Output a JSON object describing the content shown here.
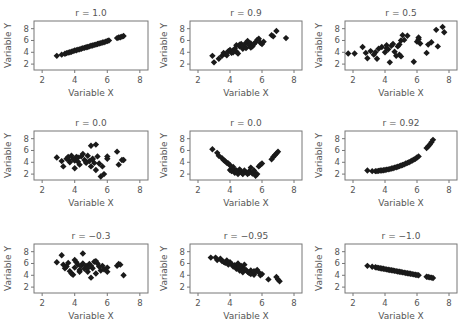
{
  "chart_data": [
    {
      "type": "scatter",
      "title": "r = 1.0",
      "xlabel": "Variable X",
      "ylabel": "Variable Y",
      "xticks": [
        2,
        4,
        6,
        8
      ],
      "yticks": [
        2,
        4,
        6,
        8
      ],
      "xlim": [
        1.5,
        8.5
      ],
      "ylim": [
        1,
        9.3
      ],
      "grid": false,
      "x": [
        2.9,
        3.2,
        3.4,
        3.5,
        3.6,
        3.7,
        3.8,
        3.9,
        4.0,
        4.1,
        4.2,
        4.3,
        4.4,
        4.5,
        4.6,
        4.7,
        4.8,
        4.9,
        5.0,
        5.1,
        5.2,
        5.3,
        5.4,
        5.5,
        5.6,
        5.7,
        5.8,
        5.9,
        6.0,
        6.1,
        6.6,
        6.7,
        6.8,
        6.9,
        7.0
      ],
      "y": [
        3.4,
        3.6,
        3.75,
        3.85,
        3.95,
        4.0,
        4.1,
        4.2,
        4.3,
        4.35,
        4.45,
        4.5,
        4.6,
        4.7,
        4.75,
        4.85,
        4.9,
        5.0,
        5.1,
        5.15,
        5.25,
        5.3,
        5.4,
        5.5,
        5.55,
        5.65,
        5.7,
        5.8,
        5.9,
        6.0,
        6.4,
        6.5,
        6.55,
        6.65,
        6.75
      ]
    },
    {
      "type": "scatter",
      "title": "r = 0.9",
      "xlabel": "Variable X",
      "ylabel": "Variable Y",
      "xticks": [
        2,
        4,
        6,
        8
      ],
      "yticks": [
        2,
        4,
        6,
        8
      ],
      "xlim": [
        1.5,
        8.5
      ],
      "ylim": [
        1,
        9.3
      ],
      "grid": false,
      "x": [
        2.9,
        3.0,
        3.3,
        3.5,
        3.6,
        3.7,
        3.9,
        4.0,
        4.1,
        4.2,
        4.3,
        4.4,
        4.4,
        4.5,
        4.6,
        4.7,
        4.8,
        4.9,
        5.0,
        5.0,
        5.1,
        5.2,
        5.3,
        5.4,
        5.5,
        5.6,
        5.7,
        5.8,
        5.9,
        6.0,
        6.1,
        6.6,
        6.7,
        6.9,
        7.5,
        4.6,
        4.2,
        3.8,
        5.3,
        4.8
      ],
      "y": [
        3.4,
        2.3,
        2.9,
        3.4,
        3.9,
        3.7,
        4.2,
        4.4,
        3.9,
        4.3,
        4.6,
        5.2,
        4.1,
        3.8,
        5.0,
        5.4,
        4.6,
        4.9,
        5.6,
        4.7,
        5.9,
        5.2,
        5.5,
        5.0,
        5.4,
        5.7,
        6.1,
        6.3,
        5.6,
        5.4,
        5.8,
        6.9,
        6.7,
        7.6,
        6.4,
        5.3,
        4.0,
        3.5,
        4.8,
        5.1
      ]
    },
    {
      "type": "scatter",
      "title": "r = 0.5",
      "xlabel": "Variable X",
      "ylabel": "Variable Y",
      "xticks": [
        2,
        4,
        6,
        8
      ],
      "yticks": [
        2,
        4,
        6,
        8
      ],
      "xlim": [
        1.5,
        8.5
      ],
      "ylim": [
        1,
        9.3
      ],
      "grid": false,
      "x": [
        1.7,
        2.1,
        2.6,
        2.8,
        2.9,
        3.1,
        3.3,
        3.5,
        3.6,
        3.8,
        4.0,
        4.1,
        4.2,
        4.3,
        4.4,
        4.5,
        4.6,
        4.7,
        4.8,
        4.9,
        5.0,
        5.1,
        5.2,
        5.4,
        5.8,
        6.0,
        6.1,
        6.2,
        6.6,
        6.7,
        6.9,
        7.2,
        7.3,
        7.6,
        7.7,
        3.4,
        4.9,
        5.0,
        4.1,
        6.1
      ],
      "y": [
        3.8,
        3.8,
        4.9,
        3.9,
        3.0,
        4.2,
        3.6,
        2.9,
        4.6,
        4.9,
        4.0,
        5.2,
        4.5,
        2.3,
        5.1,
        5.4,
        4.1,
        3.4,
        5.0,
        3.6,
        6.0,
        6.9,
        6.1,
        6.8,
        2.4,
        5.8,
        6.5,
        5.5,
        3.9,
        5.3,
        5.7,
        7.8,
        5.0,
        8.3,
        7.4,
        4.0,
        5.3,
        3.3,
        4.7,
        6.2
      ]
    },
    {
      "type": "scatter",
      "title": "r = 0.0",
      "xlabel": "Variable X",
      "ylabel": "Variable Y",
      "xticks": [
        2,
        4,
        6,
        8
      ],
      "yticks": [
        2,
        4,
        6,
        8
      ],
      "xlim": [
        1.5,
        8.5
      ],
      "ylim": [
        1,
        9.3
      ],
      "grid": false,
      "x": [
        2.9,
        3.2,
        3.3,
        3.5,
        3.6,
        3.7,
        3.8,
        3.9,
        4.0,
        4.0,
        4.1,
        4.2,
        4.3,
        4.4,
        4.5,
        4.6,
        4.7,
        4.8,
        4.9,
        5.0,
        5.0,
        5.1,
        5.2,
        5.3,
        5.3,
        5.4,
        5.5,
        5.6,
        5.7,
        5.8,
        6.0,
        6.0,
        6.6,
        6.7,
        6.9,
        7.0,
        3.6,
        4.2,
        4.7,
        5.1
      ],
      "y": [
        4.8,
        4.2,
        3.3,
        4.6,
        4.9,
        4.0,
        5.1,
        4.5,
        3.0,
        4.3,
        4.9,
        4.1,
        3.6,
        5.0,
        5.4,
        4.4,
        3.9,
        5.1,
        4.2,
        3.3,
        6.8,
        4.6,
        3.9,
        7.0,
        2.7,
        5.0,
        3.8,
        1.6,
        3.3,
        2.0,
        4.6,
        5.0,
        5.8,
        3.6,
        4.4,
        4.4,
        4.5,
        4.8,
        4.1,
        4.5
      ]
    },
    {
      "type": "scatter",
      "title": "r = 0.0",
      "xlabel": "Variable X",
      "ylabel": "Variable Y",
      "xticks": [
        2,
        4,
        6,
        8
      ],
      "yticks": [
        2,
        4,
        6,
        8
      ],
      "xlim": [
        1.5,
        8.5
      ],
      "ylim": [
        1,
        9.3
      ],
      "grid": false,
      "x": [
        2.9,
        3.2,
        3.3,
        3.5,
        3.6,
        3.7,
        3.8,
        3.9,
        4.0,
        4.0,
        4.1,
        4.2,
        4.3,
        4.4,
        4.5,
        4.6,
        4.7,
        4.8,
        4.9,
        5.0,
        5.1,
        5.2,
        5.3,
        5.4,
        5.5,
        5.6,
        5.7,
        5.8,
        5.9,
        6.0,
        6.6,
        6.7,
        6.8,
        6.9,
        7.0,
        4.4,
        4.8,
        5.2,
        4.2,
        5.5
      ],
      "y": [
        6.2,
        5.6,
        5.1,
        4.7,
        4.4,
        4.2,
        3.9,
        3.8,
        3.5,
        2.7,
        2.5,
        2.9,
        2.2,
        2.6,
        2.0,
        2.8,
        2.4,
        2.1,
        2.6,
        2.3,
        2.0,
        2.5,
        3.1,
        2.1,
        2.4,
        1.7,
        2.0,
        3.3,
        3.6,
        3.8,
        4.5,
        4.9,
        5.2,
        5.5,
        5.8,
        2.4,
        2.0,
        2.2,
        3.2,
        2.6
      ]
    },
    {
      "type": "scatter",
      "title": "r = 0.92",
      "xlabel": "Variable X",
      "ylabel": "Variable Y",
      "xticks": [
        2,
        4,
        6,
        8
      ],
      "yticks": [
        2,
        4,
        6,
        8
      ],
      "xlim": [
        1.5,
        8.5
      ],
      "ylim": [
        1,
        9.3
      ],
      "grid": false,
      "x": [
        2.9,
        3.2,
        3.4,
        3.5,
        3.6,
        3.7,
        3.8,
        3.9,
        4.0,
        4.1,
        4.2,
        4.3,
        4.4,
        4.5,
        4.6,
        4.7,
        4.8,
        4.9,
        5.0,
        5.1,
        5.2,
        5.3,
        5.4,
        5.5,
        5.6,
        5.7,
        5.8,
        5.9,
        6.0,
        6.1,
        6.6,
        6.7,
        6.8,
        6.9,
        7.0
      ],
      "y": [
        2.6,
        2.5,
        2.5,
        2.5,
        2.55,
        2.6,
        2.6,
        2.65,
        2.7,
        2.75,
        2.8,
        2.85,
        2.95,
        3.0,
        3.1,
        3.15,
        3.25,
        3.35,
        3.45,
        3.55,
        3.65,
        3.8,
        3.9,
        4.0,
        4.15,
        4.3,
        4.45,
        4.6,
        4.8,
        5.0,
        6.4,
        6.7,
        7.0,
        7.4,
        7.8
      ]
    },
    {
      "type": "scatter",
      "title": "r = −0.3",
      "xlabel": "Variable X",
      "ylabel": "Variable Y",
      "xticks": [
        2,
        4,
        6,
        8
      ],
      "yticks": [
        2,
        4,
        6,
        8
      ],
      "xlim": [
        1.5,
        8.5
      ],
      "ylim": [
        1,
        9.3
      ],
      "grid": false,
      "x": [
        2.9,
        3.2,
        3.3,
        3.5,
        3.6,
        3.7,
        3.8,
        3.9,
        4.0,
        4.0,
        4.1,
        4.2,
        4.3,
        4.4,
        4.5,
        4.5,
        4.6,
        4.7,
        4.8,
        4.9,
        5.0,
        5.1,
        5.2,
        5.3,
        5.4,
        5.5,
        5.6,
        5.7,
        5.8,
        6.0,
        6.0,
        6.6,
        6.7,
        6.8,
        7.0,
        3.4,
        4.3,
        5.0,
        5.3,
        4.8
      ],
      "y": [
        6.2,
        7.4,
        5.8,
        5.5,
        6.1,
        4.7,
        4.3,
        4.1,
        6.6,
        5.3,
        6.2,
        5.8,
        4.9,
        5.6,
        7.7,
        6.0,
        5.1,
        5.6,
        4.6,
        5.9,
        3.6,
        5.2,
        6.3,
        4.3,
        6.0,
        5.5,
        4.8,
        5.6,
        5.0,
        4.6,
        5.3,
        5.6,
        5.9,
        5.8,
        4.0,
        5.2,
        4.6,
        5.6,
        6.4,
        5.2
      ]
    },
    {
      "type": "scatter",
      "title": "r = −0.95",
      "xlabel": "Variable X",
      "ylabel": "Variable Y",
      "xticks": [
        2,
        4,
        6,
        8
      ],
      "yticks": [
        2,
        4,
        6,
        8
      ],
      "xlim": [
        1.5,
        8.5
      ],
      "ylim": [
        1,
        9.3
      ],
      "grid": false,
      "x": [
        2.8,
        3.1,
        3.2,
        3.4,
        3.5,
        3.7,
        3.8,
        3.9,
        4.0,
        4.1,
        4.2,
        4.3,
        4.4,
        4.5,
        4.5,
        4.6,
        4.7,
        4.8,
        4.9,
        5.0,
        5.1,
        5.2,
        5.3,
        5.4,
        5.5,
        5.6,
        5.7,
        5.8,
        5.9,
        6.0,
        6.4,
        6.9,
        7.0,
        7.1,
        4.6,
        4.9,
        5.3,
        3.6,
        4.8,
        5.5
      ],
      "y": [
        7.0,
        7.0,
        6.6,
        6.8,
        6.4,
        6.1,
        6.5,
        5.8,
        6.2,
        5.9,
        5.5,
        5.7,
        5.1,
        5.3,
        6.0,
        4.8,
        5.6,
        5.2,
        5.8,
        4.9,
        4.6,
        4.4,
        4.8,
        4.4,
        4.1,
        4.6,
        4.9,
        4.5,
        4.0,
        4.2,
        3.3,
        3.7,
        3.3,
        3.0,
        5.5,
        5.0,
        4.2,
        6.3,
        4.5,
        4.7
      ]
    },
    {
      "type": "scatter",
      "title": "r = −1.0",
      "xlabel": "Variable X",
      "ylabel": "Variable Y",
      "xticks": [
        2,
        4,
        6,
        8
      ],
      "yticks": [
        2,
        4,
        6,
        8
      ],
      "xlim": [
        1.5,
        8.5
      ],
      "ylim": [
        1,
        9.3
      ],
      "grid": false,
      "x": [
        2.9,
        3.2,
        3.4,
        3.5,
        3.6,
        3.7,
        3.8,
        3.9,
        4.0,
        4.1,
        4.2,
        4.3,
        4.4,
        4.5,
        4.6,
        4.7,
        4.8,
        4.9,
        5.0,
        5.1,
        5.2,
        5.3,
        5.4,
        5.5,
        5.6,
        5.7,
        5.8,
        5.9,
        6.0,
        6.1,
        6.6,
        6.7,
        6.8,
        6.9,
        7.0
      ],
      "y": [
        5.6,
        5.45,
        5.35,
        5.3,
        5.25,
        5.2,
        5.15,
        5.1,
        5.05,
        5.0,
        4.95,
        4.9,
        4.85,
        4.8,
        4.75,
        4.7,
        4.65,
        4.6,
        4.55,
        4.5,
        4.45,
        4.4,
        4.35,
        4.3,
        4.25,
        4.2,
        4.15,
        4.1,
        4.05,
        4.0,
        3.75,
        3.7,
        3.65,
        3.6,
        3.55
      ]
    }
  ],
  "layout": {
    "panels": [
      {
        "left": 34,
        "top": 21,
        "width": 114,
        "height": 49
      },
      {
        "left": 190,
        "top": 21,
        "width": 112,
        "height": 49
      },
      {
        "left": 345,
        "top": 21,
        "width": 112,
        "height": 49
      },
      {
        "left": 34,
        "top": 131,
        "width": 114,
        "height": 49
      },
      {
        "left": 190,
        "top": 131,
        "width": 112,
        "height": 49
      },
      {
        "left": 345,
        "top": 131,
        "width": 112,
        "height": 49
      },
      {
        "left": 34,
        "top": 244,
        "width": 114,
        "height": 49
      },
      {
        "left": 190,
        "top": 244,
        "width": 112,
        "height": 49
      },
      {
        "left": 345,
        "top": 244,
        "width": 112,
        "height": 49
      }
    ],
    "marker_color": "#1a1a1a",
    "axis_color": "#777777",
    "text_color": "#555555"
  }
}
